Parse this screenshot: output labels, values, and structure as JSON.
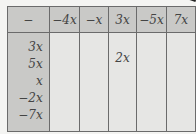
{
  "table": {
    "operator": "−",
    "column_headers": [
      "−4x",
      "−x",
      "3x",
      "−5x",
      "7x"
    ],
    "row_headers": [
      "3x",
      "5x",
      "x",
      "−2x",
      "−7x"
    ],
    "cells": [
      [
        "",
        "",
        "",
        "",
        ""
      ],
      [
        "",
        "",
        "2x",
        "",
        ""
      ],
      [
        "",
        "",
        "",
        "",
        ""
      ],
      [
        "",
        "",
        "",
        "",
        ""
      ],
      [
        "",
        "",
        "",
        "",
        ""
      ]
    ]
  },
  "colors": {
    "header_fill": "#c9c9c7",
    "cell_fill": "#e6e6e4",
    "border": "#6b6b6b"
  }
}
